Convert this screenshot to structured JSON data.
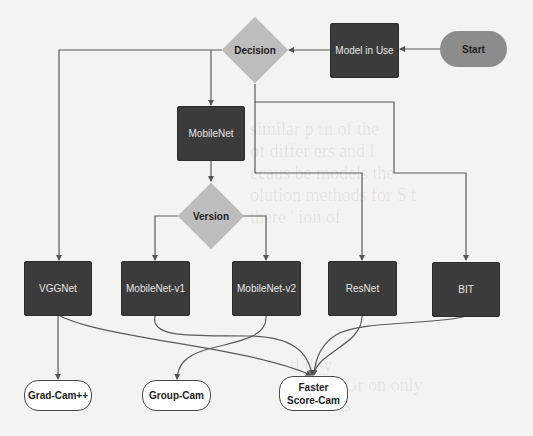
{
  "diagram": {
    "type": "flowchart",
    "colors": {
      "background": "#f3f3f1",
      "process_box": "#3b3b3b",
      "decision": "#bdbdbd",
      "start": "#8c8c8c",
      "output": "#ffffff",
      "edge": "#555555"
    },
    "nodes": {
      "start": {
        "label": "Start",
        "shape": "pill"
      },
      "model_in_use": {
        "label": "Model in Use",
        "shape": "box"
      },
      "decision": {
        "label": "Decision",
        "shape": "diamond"
      },
      "mobilenet": {
        "label": "MobileNet",
        "shape": "box"
      },
      "version": {
        "label": "Version",
        "shape": "diamond"
      },
      "vggnet": {
        "label": "VGGNet",
        "shape": "box"
      },
      "mobilenet_v1": {
        "label": "MobileNet-v1",
        "shape": "box"
      },
      "mobilenet_v2": {
        "label": "MobileNet-v2",
        "shape": "box"
      },
      "resnet": {
        "label": "ResNet",
        "shape": "box"
      },
      "bit": {
        "label": "BIT",
        "shape": "box"
      },
      "grad_cam_pp": {
        "label": "Grad-Cam++",
        "shape": "rounded"
      },
      "group_cam": {
        "label": "Group-Cam",
        "shape": "rounded"
      },
      "faster_score_cam": {
        "label_line1": "Faster",
        "label_line2": "Score-Cam",
        "shape": "rounded"
      }
    },
    "edges": [
      {
        "from": "Start",
        "to": "Model in Use"
      },
      {
        "from": "Model in Use",
        "to": "Decision"
      },
      {
        "from": "Decision",
        "to": "VGGNet"
      },
      {
        "from": "Decision",
        "to": "MobileNet"
      },
      {
        "from": "Decision",
        "to": "ResNet"
      },
      {
        "from": "Decision",
        "to": "BIT"
      },
      {
        "from": "MobileNet",
        "to": "Version"
      },
      {
        "from": "Version",
        "to": "MobileNet-v1"
      },
      {
        "from": "Version",
        "to": "MobileNet-v2"
      },
      {
        "from": "VGGNet",
        "to": "Grad-Cam++"
      },
      {
        "from": "VGGNet",
        "to": "Faster Score-Cam"
      },
      {
        "from": "MobileNet-v1",
        "to": "Faster Score-Cam"
      },
      {
        "from": "MobileNet-v2",
        "to": "Group-Cam"
      },
      {
        "from": "ResNet",
        "to": "Faster Score-Cam"
      },
      {
        "from": "BIT",
        "to": "Faster Score-Cam"
      }
    ]
  },
  "background_bleed": {
    "lines": [
      "similar p          rn      of the",
      "of differ        ers         and l",
      "ecaus         be models        the",
      "olution methods for        S t",
      "there    '        ion           of"
    ],
    "lines2": [
      "          tl     th            y",
      "on b       ar  Gr         on  only",
      "t        e        en   r         s"
    ]
  }
}
